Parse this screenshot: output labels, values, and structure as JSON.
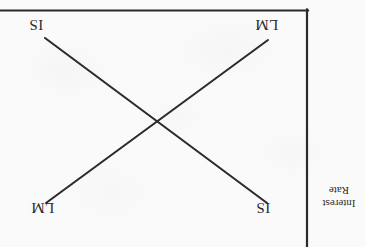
{
  "figure": {
    "type": "is-lm-diagram",
    "orientation": "rotated-180",
    "background_color": "#fbfafa",
    "ink_color": "#2a2a2a",
    "axis_label": {
      "line1": "Interest",
      "line2": "Rate",
      "full": "Interest Rate"
    },
    "curve_labels": {
      "top_left": "IS",
      "top_right": "LM",
      "bottom_left": "LM",
      "bottom_right": "IS"
    }
  },
  "chart_data": {
    "type": "line",
    "title": "",
    "xlabel": "",
    "ylabel": "Interest Rate",
    "grid": false,
    "legend": "none",
    "note": "Standard IS-LM cross, image scanned upside down (rotated 180 degrees). No numeric tick values are printed on either axis.",
    "axes": [
      {
        "name": "interest-rate-axis",
        "role": "vertical-axis (appears at right edge due to 180 rotation)",
        "x1": 307,
        "y1": 10,
        "x2": 307,
        "y2": 247,
        "ticks": [],
        "tick_labels": []
      },
      {
        "name": "output-axis",
        "role": "horizontal-axis (appears at top edge due to 180 rotation)",
        "x1": 0,
        "y1": 10,
        "x2": 308,
        "y2": 10,
        "ticks": [],
        "tick_labels": []
      }
    ],
    "series": [
      {
        "name": "IS",
        "label": "IS",
        "label_positions": [
          "top-left",
          "bottom-right"
        ],
        "slope_sign": "negative-in-original-orientation",
        "points": [
          [
            45,
            38
          ],
          [
            267,
            203
          ]
        ]
      },
      {
        "name": "LM",
        "label": "LM",
        "label_positions": [
          "bottom-left",
          "top-right"
        ],
        "slope_sign": "positive-in-original-orientation",
        "points": [
          [
            46,
            203
          ],
          [
            268,
            40
          ]
        ]
      }
    ],
    "intersection": [
      155,
      124
    ],
    "xlim": [
      0,
      365
    ],
    "ylim": [
      0,
      247
    ]
  }
}
